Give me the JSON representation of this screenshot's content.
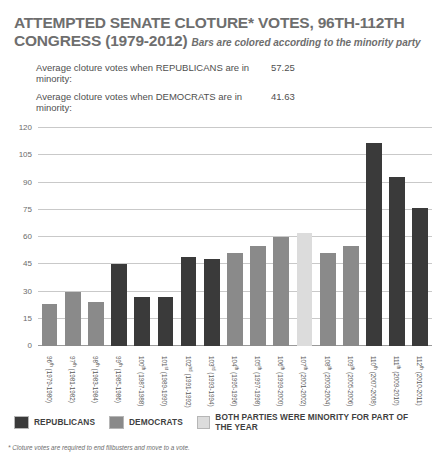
{
  "header": {
    "title": "ATTEMPTED SENATE CLOTURE* VOTES, 96TH-112TH CONGRESS (1979-2012)",
    "subtitle": "Bars are colored according to the minority party",
    "averages": [
      {
        "label": "Average cloture votes when REPUBLICANS are in minority:",
        "value": "57.25"
      },
      {
        "label": "Average cloture votes when DEMOCRATS are in minority:",
        "value": "41.63"
      }
    ]
  },
  "legend": [
    {
      "name": "legend-republicans",
      "label": "REPUBLICANS",
      "color": "#3a3a3a"
    },
    {
      "name": "legend-democrats",
      "label": "DEMOCRATS",
      "color": "#8a8a8a"
    },
    {
      "name": "legend-both",
      "label": "BOTH PARTIES WERE MINORITY FOR PART OF THE YEAR",
      "color": "#dcdcdc"
    }
  ],
  "footnote": "* Cloture votes are required to end filibusters and move to a vote.",
  "colors": {
    "republican": "#3a3a3a",
    "democrat": "#8a8a8a",
    "both": "#dcdcdc",
    "gridline": "#c9c9c9",
    "title": "#6e6e6e"
  },
  "chart_data": {
    "type": "bar",
    "title": "ATTEMPTED SENATE CLOTURE* VOTES, 96TH-112TH CONGRESS (1979-2012)",
    "subtitle": "Bars are colored according to the minority party",
    "xlabel": "",
    "ylabel": "",
    "ylim": [
      0,
      120
    ],
    "yticks": [
      120,
      105,
      90,
      75,
      60,
      45,
      30,
      15,
      0
    ],
    "grid": true,
    "legend_position": "bottom",
    "categories": [
      "96th (1979-1980)",
      "97th (1981-1982)",
      "98th (1983-1984)",
      "99th (1985-1986)",
      "100th (1987-1988)",
      "101st (1989-1990)",
      "102nd (1991-1992)",
      "103rd (1993-1994)",
      "104th (1995-1996)",
      "105th (1997-1998)",
      "106th (1999-2000)",
      "107th (2001-2002)",
      "108th (2003-2004)",
      "109th (2005-2006)",
      "110th (2007-2008)",
      "111th (2009-2010)",
      "112th (2010-2011)"
    ],
    "category_parts": [
      {
        "ordinal": "96",
        "sup": "th",
        "years": "(1979-1980)"
      },
      {
        "ordinal": "97",
        "sup": "th",
        "years": "(1981-1982)"
      },
      {
        "ordinal": "98",
        "sup": "th",
        "years": "(1983-1984)"
      },
      {
        "ordinal": "99",
        "sup": "th",
        "years": "(1985-1986)"
      },
      {
        "ordinal": "100",
        "sup": "th",
        "years": "(1987-1988)"
      },
      {
        "ordinal": "101",
        "sup": "st",
        "years": "(1989-1990)"
      },
      {
        "ordinal": "102",
        "sup": "nd",
        "years": "(1991-1992)"
      },
      {
        "ordinal": "103",
        "sup": "rd",
        "years": "(1993-1994)"
      },
      {
        "ordinal": "104",
        "sup": "th",
        "years": "(1995-1996)"
      },
      {
        "ordinal": "105",
        "sup": "th",
        "years": "(1997-1998)"
      },
      {
        "ordinal": "106",
        "sup": "th",
        "years": "(1999-2000)"
      },
      {
        "ordinal": "107",
        "sup": "th",
        "years": "(2001-2002)"
      },
      {
        "ordinal": "108",
        "sup": "th",
        "years": "(2003-2004)"
      },
      {
        "ordinal": "109",
        "sup": "th",
        "years": "(2005-2006)"
      },
      {
        "ordinal": "110",
        "sup": "th",
        "years": "(2007-2008)"
      },
      {
        "ordinal": "111",
        "sup": "th",
        "years": "(2009-2010)"
      },
      {
        "ordinal": "112",
        "sup": "th",
        "years": "(2010-2011)"
      }
    ],
    "values": [
      23,
      30,
      24,
      45,
      27,
      27,
      49,
      48,
      51,
      55,
      60,
      62,
      51,
      55,
      112,
      93,
      76
    ],
    "bar_minority": [
      "democrat",
      "democrat",
      "democrat",
      "republican",
      "republican",
      "republican",
      "republican",
      "republican",
      "democrat",
      "democrat",
      "democrat",
      "both",
      "democrat",
      "democrat",
      "republican",
      "republican",
      "republican"
    ]
  }
}
